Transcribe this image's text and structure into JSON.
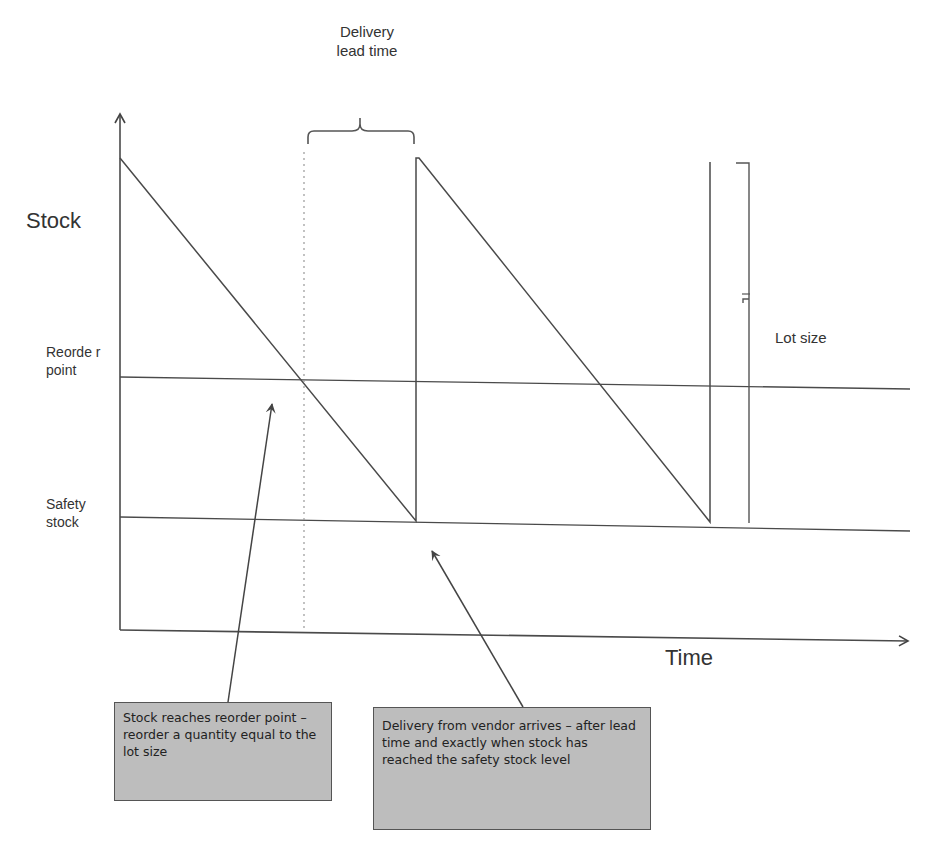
{
  "diagram": {
    "type": "inventory-sawtooth",
    "labels": {
      "delivery_lead_time_line1": "Delivery",
      "delivery_lead_time_line2": "lead time",
      "y_axis": "Stock",
      "x_axis": "Time",
      "reorder_point": "Reorde r point",
      "safety_stock_line1": "Safety",
      "safety_stock_line2": "stock",
      "lot_size": "Lot size"
    },
    "callouts": [
      {
        "text": "Stock reaches reorder point – reorder a quantity equal to the lot size"
      },
      {
        "text": "Delivery from vendor arrives – after lead time and exactly when stock has reached the safety stock level"
      }
    ],
    "colors": {
      "line": "#4a4a4a",
      "callout_fill": "#bdbdbd",
      "callout_border": "#555555"
    }
  }
}
